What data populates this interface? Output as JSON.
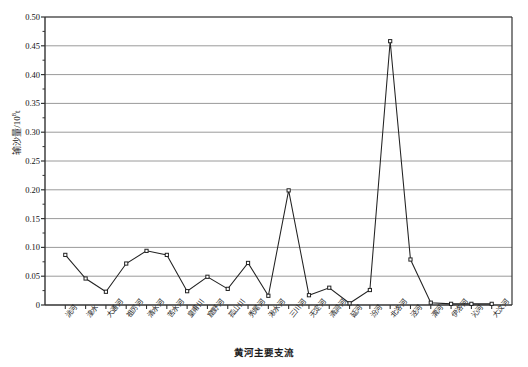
{
  "chart_data": {
    "type": "line",
    "title": "",
    "xlabel": "黄河主要支流",
    "ylabel_text": "输沙量/10",
    "ylabel_sup": "8",
    "ylabel_unit": "t",
    "ylabel": "输沙量/10⁸t",
    "ylim": [
      0,
      0.5
    ],
    "ytick_labels": [
      "0.50",
      "0.45",
      "0.40",
      "0.35",
      "0.30",
      "0.25",
      "0.20",
      "0.15",
      "0.10",
      "0.05",
      "0"
    ],
    "ytick_values": [
      0.5,
      0.45,
      0.4,
      0.35,
      0.3,
      0.25,
      0.2,
      0.15,
      0.1,
      0.05,
      0
    ],
    "grid": true,
    "grid_axis": "y",
    "legend": "none",
    "marker": "open-square",
    "line_color": "#222222",
    "grid_color": "#9a9a9a",
    "axis_color": "#333333",
    "categories": [
      "洮河",
      "湟水",
      "大通河",
      "祖厉河",
      "清水河",
      "苦水河",
      "皇甫川",
      "窟野河",
      "孤山川",
      "秃尾河",
      "湫水河",
      "三川河",
      "无定河",
      "清涧河",
      "延河",
      "汾河",
      "北洛河",
      "泾河",
      "渭河",
      "伊洛河",
      "沁河",
      "大汶河"
    ],
    "values": [
      0.087,
      0.046,
      0.023,
      0.072,
      0.094,
      0.087,
      0.024,
      0.049,
      0.028,
      0.073,
      0.016,
      0.199,
      0.017,
      0.03,
      0.003,
      0.026,
      0.458,
      0.079,
      0.004,
      0.002,
      0.002,
      0.002
    ]
  }
}
